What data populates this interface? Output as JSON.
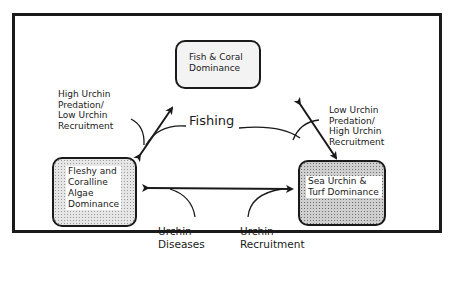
{
  "diagram": {
    "nodes": {
      "fish_coral": {
        "label": "Fish & Coral\nDominance"
      },
      "algae": {
        "label": "Fleshy and\nCoralline\nAlgae\nDominance"
      },
      "urchin_turf": {
        "label": "Sea Urchin &\nTurf Dominance"
      }
    },
    "edge_labels": {
      "high_predation": "High Urchin\nPredation/\nLow Urchin\nRecruitment",
      "low_predation": "Low Urchin\nPredation/\nHigh Urchin\nRecruitment",
      "fishing": "Fishing",
      "urchin_diseases": "Urchin\nDiseases",
      "urchin_recruitment": "Urchin\nRecruitment"
    },
    "edges": [
      {
        "from": "algae",
        "to": "fish_coral",
        "direction": "bidirectional"
      },
      {
        "from": "urchin_turf",
        "to": "fish_coral",
        "direction": "bidirectional"
      },
      {
        "from": "algae",
        "to": "urchin_turf",
        "direction": "bidirectional"
      }
    ],
    "colors": {
      "stroke": "#1a1a1a",
      "light_fill": "#f3f3f3",
      "dotted_fill": "#e6e6e6",
      "dark_fill": "#cfcfcf"
    }
  }
}
